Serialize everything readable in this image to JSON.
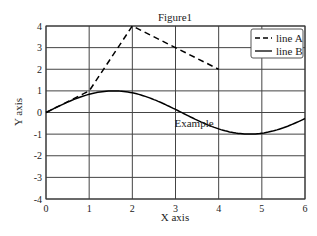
{
  "chart_data": {
    "type": "line",
    "title": "Figure1",
    "xlabel": "X axis",
    "ylabel": "Y axis",
    "xlim": [
      0,
      6
    ],
    "ylim": [
      -4,
      4
    ],
    "xticks": [
      0,
      1,
      2,
      3,
      4,
      5,
      6
    ],
    "yticks": [
      -4,
      -3,
      -2,
      -1,
      0,
      1,
      2,
      3,
      4
    ],
    "grid": true,
    "legend_position": "upper right",
    "series": [
      {
        "name": "line A",
        "style": "dashed",
        "color": "#000000",
        "x": [
          0,
          1,
          2,
          4
        ],
        "y": [
          0,
          1,
          4,
          2
        ]
      },
      {
        "name": "line B",
        "style": "solid",
        "color": "#000000",
        "function": "sin(x)",
        "x": [
          0,
          0.5,
          1,
          1.5,
          2,
          2.5,
          3,
          3.5,
          4,
          4.5,
          5,
          5.5,
          6
        ],
        "y": [
          0,
          0.48,
          0.84,
          1.0,
          0.91,
          0.6,
          0.14,
          -0.35,
          -0.76,
          -0.98,
          -0.96,
          -0.71,
          -0.28
        ]
      }
    ],
    "annotations": [
      {
        "text": "Example",
        "x": 3,
        "y": -0.3
      }
    ]
  },
  "labels": {
    "title": "Figure1",
    "xlabel": "X axis",
    "ylabel": "Y axis",
    "legend": [
      "line A",
      "line B"
    ],
    "annotation": "Example"
  }
}
